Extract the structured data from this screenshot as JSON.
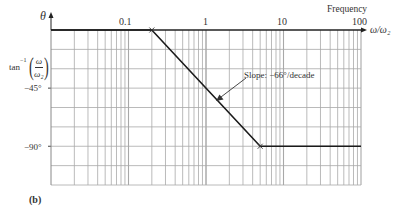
{
  "figure_label": "(b)",
  "y_axis": {
    "symbol": "θ",
    "label_func": "tan",
    "label_exp": "−1",
    "label_num": "ω",
    "label_den": "ω₂",
    "tick_labels": [
      "−45°",
      "−90°"
    ]
  },
  "x_axis": {
    "title": "Frequency",
    "label": "ω/ω₂",
    "tick_labels": [
      "0.1",
      "1",
      "10",
      "100"
    ]
  },
  "annotation": {
    "text": "Slope: −66°/decade"
  },
  "colors": {
    "grid": "#a8a8a8",
    "curve": "#1a1a1a",
    "axis": "#222222"
  },
  "chart_data": {
    "type": "line",
    "title": "",
    "xlabel": "ω/ω₂",
    "ylabel": "θ = tan⁻¹(ω/ω₂)",
    "x_scale": "log",
    "xlim": [
      0.01,
      100
    ],
    "ylim": [
      -120,
      0
    ],
    "grid": true,
    "x_ticks": [
      0.1,
      1,
      10,
      100
    ],
    "y_ticks": [
      -45,
      -90
    ],
    "y_grid_step_deg": 15,
    "series": [
      {
        "name": "Asymptotic phase approximation",
        "x": [
          0.01,
          0.2,
          5,
          100
        ],
        "y": [
          0,
          0,
          -90,
          -90
        ]
      }
    ],
    "breakpoints": [
      {
        "x": 0.2,
        "y": 0,
        "marker": "x"
      },
      {
        "x": 5,
        "y": -90,
        "marker": "x"
      }
    ],
    "annotations": [
      {
        "text": "Slope: −66°/decade",
        "points_to": {
          "x": 1,
          "y": -45
        }
      }
    ],
    "legend": "none"
  }
}
